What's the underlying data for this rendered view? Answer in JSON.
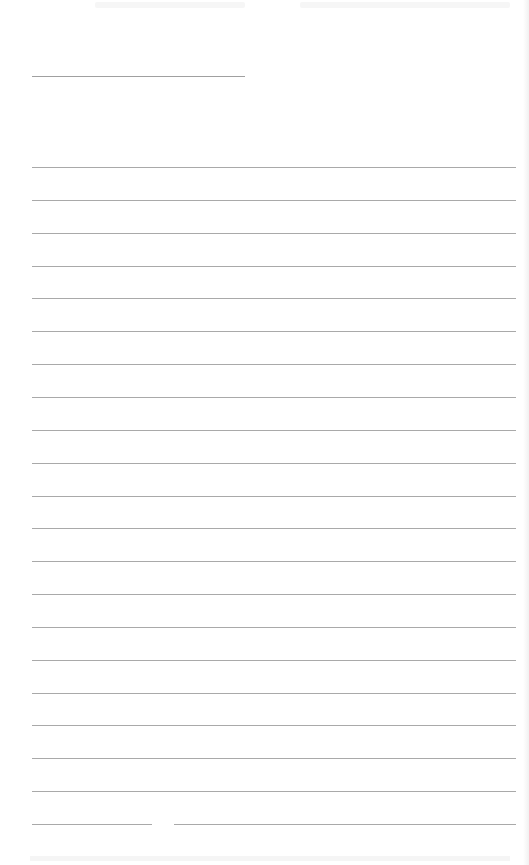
{
  "document": {
    "type": "lined-paper",
    "header_line": {
      "x": 32,
      "y": 76,
      "width": 213
    },
    "lines": {
      "count": 21,
      "first_y": 167,
      "spacing": 32.85,
      "left_x": 32,
      "right_x": 516,
      "color": "#a9a9a9"
    },
    "last_line_gap": {
      "from_x": 152,
      "to_x": 174
    },
    "background_color": "#ffffff"
  }
}
